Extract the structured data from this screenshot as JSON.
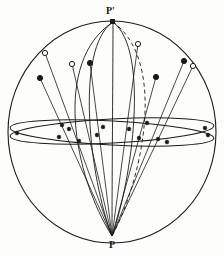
{
  "figure": {
    "type": "stereographic-projection-sphere",
    "background_color": "#fdfdfc",
    "line_color": "#1a1a1a",
    "width": 224,
    "height": 256
  },
  "labels": {
    "north_pole": "P'",
    "south_pole": "P"
  },
  "sphere": {
    "center_x": 112,
    "center_y": 132,
    "radius_x": 104,
    "radius_y": 111,
    "stroke_width": 1.1
  },
  "projection_point": {
    "name": "P",
    "x": 112,
    "y": 236
  },
  "north_point": {
    "name": "P'",
    "x": 113,
    "y": 22
  },
  "equator_ellipses": [
    {
      "cx": 112,
      "cy": 131,
      "rx": 102,
      "ry": 12,
      "rotate": -3.0
    },
    {
      "cx": 112,
      "cy": 133,
      "rx": 102,
      "ry": 12,
      "rotate": 3.0
    }
  ],
  "meridians": [
    {
      "id": "meridian-1",
      "dash": false,
      "c1x": 52,
      "c1y": 62,
      "c2x": 74,
      "c2y": 176
    },
    {
      "id": "meridian-2",
      "dash": false,
      "c1x": 74,
      "c1y": 48,
      "c2x": 90,
      "c2y": 180
    },
    {
      "id": "meridian-3",
      "dash": false,
      "c1x": 113,
      "c1y": 60,
      "c2x": 112,
      "c2y": 180
    },
    {
      "id": "meridian-4",
      "dash": false,
      "c1x": 150,
      "c1y": 50,
      "c2x": 132,
      "c2y": 180
    },
    {
      "id": "meridian-5",
      "dash": true,
      "c1x": 168,
      "c1y": 62,
      "c2x": 142,
      "c2y": 180
    }
  ],
  "markers": [
    {
      "id": "m1",
      "x": 40,
      "y": 78,
      "style": "filled"
    },
    {
      "id": "m2",
      "x": 45,
      "y": 53,
      "style": "hollow"
    },
    {
      "id": "m3",
      "x": 72,
      "y": 64,
      "style": "hollow"
    },
    {
      "id": "m4",
      "x": 90,
      "y": 63,
      "style": "filled"
    },
    {
      "id": "m5",
      "x": 138,
      "y": 44,
      "style": "hollow"
    },
    {
      "id": "m6",
      "x": 156,
      "y": 77,
      "style": "filled"
    },
    {
      "id": "m7",
      "x": 184,
      "y": 61,
      "style": "filled"
    },
    {
      "id": "m8",
      "x": 193,
      "y": 66,
      "style": "hollow"
    }
  ],
  "projection_lines": [
    {
      "id": "pl1",
      "x1": 40,
      "y1": 78,
      "x2": 112,
      "y2": 236
    },
    {
      "id": "pl2",
      "x1": 45,
      "y1": 53,
      "x2": 112,
      "y2": 236
    },
    {
      "id": "pl3",
      "x1": 72,
      "y1": 64,
      "x2": 112,
      "y2": 236
    },
    {
      "id": "pl4",
      "x1": 90,
      "y1": 63,
      "x2": 112,
      "y2": 236
    },
    {
      "id": "pl5",
      "x1": 138,
      "y1": 44,
      "x2": 112,
      "y2": 236
    },
    {
      "id": "pl6",
      "x1": 156,
      "y1": 77,
      "x2": 112,
      "y2": 236
    },
    {
      "id": "pl7",
      "x1": 184,
      "y1": 61,
      "x2": 112,
      "y2": 236
    },
    {
      "id": "pl8",
      "x1": 193,
      "y1": 66,
      "x2": 112,
      "y2": 236
    }
  ],
  "equator_intersections": [
    {
      "id": "e1",
      "x": 59,
      "y": 137,
      "style": "filled"
    },
    {
      "id": "e2",
      "x": 69,
      "y": 129,
      "style": "filled"
    },
    {
      "id": "e3",
      "x": 79,
      "y": 141,
      "style": "filled"
    },
    {
      "id": "e4",
      "x": 62,
      "y": 125,
      "style": "filled"
    },
    {
      "id": "e5",
      "x": 97,
      "y": 135,
      "style": "filled"
    },
    {
      "id": "e6",
      "x": 103,
      "y": 127,
      "style": "filled"
    },
    {
      "id": "e7",
      "x": 129,
      "y": 129,
      "style": "filled"
    },
    {
      "id": "e8",
      "x": 139,
      "y": 138,
      "style": "filled"
    },
    {
      "id": "e9",
      "x": 147,
      "y": 123,
      "style": "filled"
    },
    {
      "id": "e10",
      "x": 158,
      "y": 139,
      "style": "filled"
    },
    {
      "id": "e11",
      "x": 167,
      "y": 142,
      "style": "filled"
    },
    {
      "id": "e12",
      "x": 205,
      "y": 128,
      "style": "filled"
    },
    {
      "id": "e13",
      "x": 17,
      "y": 133,
      "style": "filled"
    },
    {
      "id": "e14",
      "x": 208,
      "y": 135,
      "style": "filled"
    }
  ]
}
